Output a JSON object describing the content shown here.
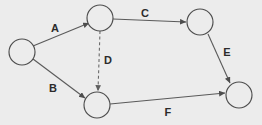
{
  "diagram": {
    "background_color": "#ececec",
    "node_stroke_color": "#4d4d4d",
    "node_fill_color": "#ececec",
    "edge_color": "#5a5a5a",
    "label_color": "#2b2b2b",
    "node_radius": 13,
    "nodes": [
      {
        "id": "n1",
        "label": "",
        "cx": 22,
        "cy": 52
      },
      {
        "id": "n2",
        "label": "",
        "cx": 100,
        "cy": 18
      },
      {
        "id": "n3",
        "label": "",
        "cx": 200,
        "cy": 22
      },
      {
        "id": "n4",
        "label": "",
        "cx": 97,
        "cy": 105
      },
      {
        "id": "n5",
        "label": "",
        "cx": 239,
        "cy": 95
      }
    ],
    "edges": [
      {
        "id": "edge-a",
        "label": "A",
        "from": "n1",
        "to": "n2",
        "style": "solid",
        "label_x": 55,
        "label_y": 28,
        "x1": 33,
        "y1": 46,
        "x2": 89,
        "y2": 23
      },
      {
        "id": "edge-b",
        "label": "B",
        "from": "n1",
        "to": "n4",
        "style": "solid",
        "label_x": 53,
        "label_y": 88,
        "x1": 33,
        "y1": 59,
        "x2": 85,
        "y2": 98
      },
      {
        "id": "edge-c",
        "label": "C",
        "from": "n2",
        "to": "n3",
        "style": "solid",
        "label_x": 145,
        "label_y": 13,
        "x1": 113,
        "y1": 19,
        "x2": 186,
        "y2": 22
      },
      {
        "id": "edge-d",
        "label": "D",
        "from": "n2",
        "to": "n4",
        "style": "dashed",
        "label_x": 108,
        "label_y": 60,
        "x1": 100,
        "y1": 31,
        "x2": 98,
        "y2": 91
      },
      {
        "id": "edge-e",
        "label": "E",
        "from": "n3",
        "to": "n5",
        "style": "solid",
        "label_x": 227,
        "label_y": 52,
        "x1": 208,
        "y1": 34,
        "x2": 230,
        "y2": 83
      },
      {
        "id": "edge-f",
        "label": "F",
        "from": "n4",
        "to": "n5",
        "style": "solid",
        "label_x": 168,
        "label_y": 112,
        "x1": 110,
        "y1": 104,
        "x2": 225,
        "y2": 93
      }
    ]
  }
}
